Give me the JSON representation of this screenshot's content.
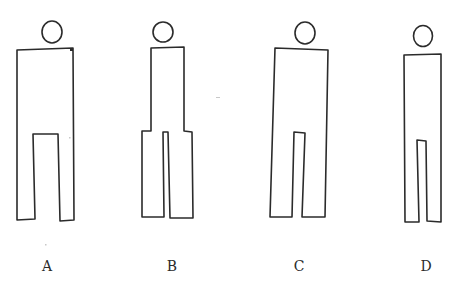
{
  "figures": [
    {
      "id": "A",
      "label": "A",
      "description": "Stick-style figure with wide rectangular body and wide leg gap"
    },
    {
      "id": "B",
      "label": "B",
      "description": "Figure with narrow torso widening at hips, narrow leg gap"
    },
    {
      "id": "C",
      "label": "C",
      "description": "Figure with wide rectangular body and narrow leg gap"
    },
    {
      "id": "D",
      "label": "D",
      "description": "Figure with narrow rectangular body and very narrow leg gap"
    }
  ],
  "colors": {
    "ink": "#2b2b2b",
    "background": "#ffffff"
  }
}
